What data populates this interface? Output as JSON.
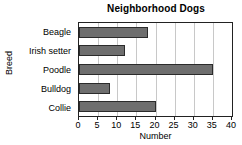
{
  "chart_data": {
    "type": "bar",
    "orientation": "horizontal",
    "title": "Neighborhood Dogs",
    "xlabel": "Number",
    "ylabel": "Breed",
    "categories": [
      "Beagle",
      "Irish setter",
      "Poodle",
      "Bulldog",
      "Collie"
    ],
    "values": [
      18,
      12,
      35,
      8,
      20
    ],
    "xlim": [
      0,
      40
    ],
    "xticks": [
      0,
      5,
      10,
      15,
      20,
      25,
      30,
      35,
      40
    ],
    "xticklabels": [
      "0",
      "5",
      "10",
      "15",
      "20",
      "25",
      "30",
      "35",
      "40"
    ],
    "grid": "vertical",
    "legend": "none",
    "colors": {
      "bar_fill": "#6e6e6e",
      "bar_edge": "#2b2b2b",
      "gridline": "#c8c8c8",
      "frame": "#222222",
      "text": "#000000",
      "background": "#ffffff"
    }
  }
}
